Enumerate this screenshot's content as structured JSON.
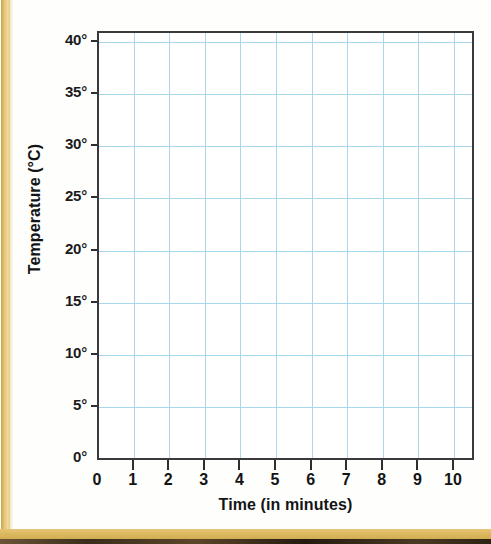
{
  "page": {
    "background_color": "#fefefc",
    "edge_strip_color": "#e2c371",
    "edge_bottom_color": "#dcb95f"
  },
  "chart_data": {
    "type": "line",
    "title": "",
    "subtitle": "",
    "xlabel": "Time (in minutes)",
    "ylabel": "Temperature (°C)",
    "xlim": [
      0,
      10
    ],
    "ylim": [
      0,
      40
    ],
    "xticks": [
      0,
      1,
      2,
      3,
      4,
      5,
      6,
      7,
      8,
      9,
      10
    ],
    "yticks": [
      0,
      5,
      10,
      15,
      20,
      25,
      30,
      35,
      40
    ],
    "xticklabels": [
      "0",
      "1",
      "2",
      "3",
      "4",
      "5",
      "6",
      "7",
      "8",
      "9",
      "10"
    ],
    "yticklabels": [
      "0°",
      "5°",
      "10°",
      "15°",
      "20°",
      "25°",
      "30°",
      "35°",
      "40°"
    ],
    "grid": true,
    "grid_color": "#a9d7ee",
    "axis_color": "#3a3a3c",
    "legend": null,
    "legend_position": "none",
    "series": [],
    "x": [],
    "values": [],
    "annotations": [],
    "note": "Blank plotting grid — no data series plotted"
  },
  "axis": {
    "y_title": "Temperature (°C)",
    "x_title": "Time (in minutes)"
  }
}
